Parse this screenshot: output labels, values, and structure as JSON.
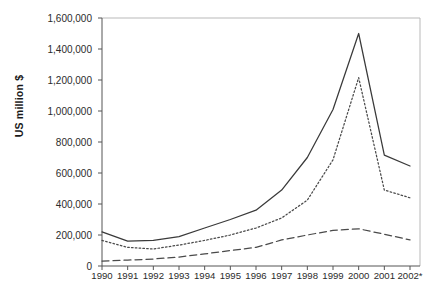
{
  "chart_data": {
    "type": "line",
    "title": "",
    "xlabel": "",
    "ylabel": "US million $",
    "categories": [
      "1990",
      "1991",
      "1992",
      "1993",
      "1994",
      "1995",
      "1996",
      "1997",
      "1998",
      "1999",
      "2000",
      "2001",
      "2002*"
    ],
    "x": [
      1990,
      1991,
      1992,
      1993,
      1994,
      1995,
      1996,
      1997,
      1998,
      1999,
      2000,
      2001,
      2002
    ],
    "ylim": [
      0,
      1600000
    ],
    "xlim": [
      1990,
      2002
    ],
    "ytick_labels": [
      "0",
      "200,000",
      "400,000",
      "600,000",
      "800,000",
      "1,000,000",
      "1,200,000",
      "1,400,000",
      "1,600,000"
    ],
    "ytick_values": [
      0,
      200000,
      400000,
      600000,
      800000,
      1000000,
      1200000,
      1400000,
      1600000
    ],
    "grid": false,
    "legend": "none",
    "series": [
      {
        "name": "series-solid",
        "style": "solid",
        "color": "#3a3a3a",
        "values": [
          220000,
          160000,
          165000,
          190000,
          245000,
          300000,
          360000,
          490000,
          700000,
          1010000,
          1500000,
          715000,
          645000
        ]
      },
      {
        "name": "series-dotted",
        "style": "dotted",
        "color": "#4a4a4a",
        "values": [
          165000,
          120000,
          110000,
          135000,
          165000,
          200000,
          245000,
          310000,
          425000,
          685000,
          1215000,
          490000,
          440000
        ]
      },
      {
        "name": "series-dashed",
        "style": "dashed",
        "color": "#4a4a4a",
        "values": [
          32000,
          38000,
          45000,
          58000,
          78000,
          100000,
          120000,
          168000,
          200000,
          230000,
          240000,
          205000,
          168000
        ]
      }
    ]
  }
}
